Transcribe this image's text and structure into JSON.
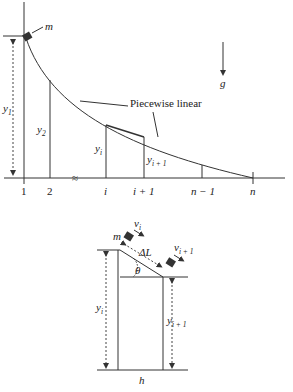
{
  "top_diagram": {
    "mass_label": "m",
    "gravity_label": "g",
    "curve_label": "Piecewise linear",
    "heights": {
      "y1": {
        "base": "y",
        "sub": "1"
      },
      "y2": {
        "base": "y",
        "sub": "2"
      },
      "yi": {
        "base": "y",
        "sub": "i"
      },
      "yi1": {
        "base": "y",
        "sub": "i + 1"
      }
    },
    "axis_ticks": [
      "1",
      "2",
      "i",
      "i + 1",
      "n − 1",
      "n"
    ],
    "break_mark": "≈"
  },
  "bottom_diagram": {
    "mass_label": "m",
    "velocity_i": {
      "base": "v",
      "sub": "i"
    },
    "velocity_i1": {
      "base": "v",
      "sub": "i + 1"
    },
    "segment_label": "ΔL",
    "angle_label": "θ",
    "height_i": {
      "base": "y",
      "sub": "i"
    },
    "height_i1": {
      "base": "y",
      "sub": "i + 1"
    },
    "width_label": "h"
  }
}
